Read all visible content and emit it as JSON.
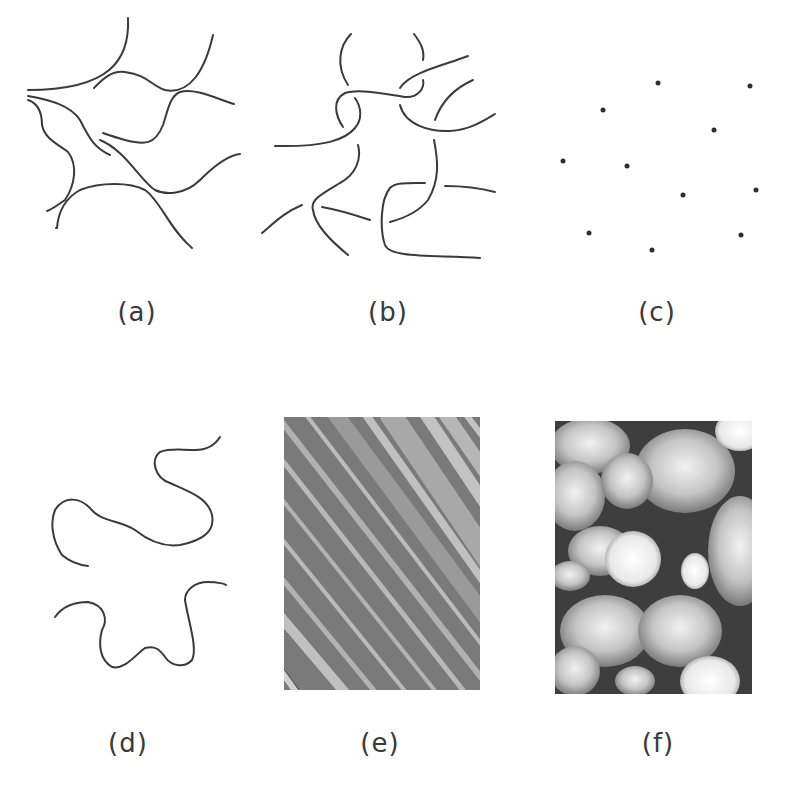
{
  "figure": {
    "panels": [
      {
        "id": "a",
        "label": "(a)",
        "content": "network of curved fibers (strands)"
      },
      {
        "id": "b",
        "label": "(b)",
        "content": "short curved fiber segments"
      },
      {
        "id": "c",
        "label": "(c)",
        "content": "scattered dots",
        "dot_count": 12
      },
      {
        "id": "d",
        "label": "(d)",
        "content": "two long wavy chains"
      },
      {
        "id": "e",
        "label": "(e)",
        "content": "micrograph with diagonal lamellar stripes"
      },
      {
        "id": "f",
        "label": "(f)",
        "content": "micrograph with bright domains in dark matrix"
      }
    ]
  },
  "colors": {
    "ink": "#3a3a3a",
    "background": "#ffffff",
    "stripe_dark": "#6e6e6e",
    "stripe_light": "#b4b4b4",
    "matrix_dark": "#3a3a3a",
    "domain_light": "#d8d8d8"
  }
}
